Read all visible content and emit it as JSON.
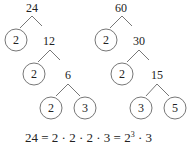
{
  "trees": [
    {
      "root": "24",
      "nodes": [
        {
          "value": "24",
          "type": "composite"
        },
        {
          "value": "2",
          "type": "prime"
        },
        {
          "value": "12",
          "type": "composite"
        },
        {
          "value": "2",
          "type": "prime"
        },
        {
          "value": "6",
          "type": "composite"
        },
        {
          "value": "2",
          "type": "prime"
        },
        {
          "value": "3",
          "type": "prime"
        }
      ]
    },
    {
      "root": "60",
      "nodes": [
        {
          "value": "60",
          "type": "composite"
        },
        {
          "value": "2",
          "type": "prime"
        },
        {
          "value": "30",
          "type": "composite"
        },
        {
          "value": "2",
          "type": "prime"
        },
        {
          "value": "15",
          "type": "composite"
        },
        {
          "value": "3",
          "type": "prime"
        },
        {
          "value": "5",
          "type": "prime"
        }
      ]
    }
  ],
  "equation": {
    "lhs": "24 = 2 · 2 · 2 · 3 = 2",
    "exponent": "3",
    "tail": " · 3"
  }
}
